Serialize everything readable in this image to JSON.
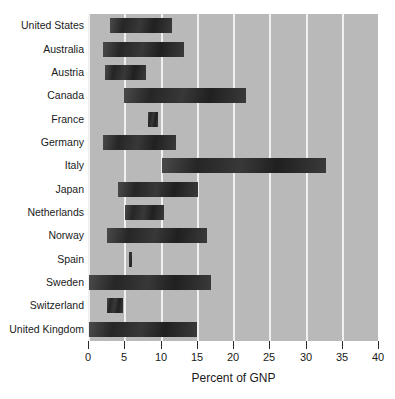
{
  "chart_data": {
    "type": "bar",
    "orientation": "horizontal",
    "bar_style": "floating-range",
    "title": "",
    "subtitle": "",
    "xlabel": "Percent of GNP",
    "ylabel": "",
    "xlim": [
      0,
      40
    ],
    "ylim": null,
    "xticks": [
      0,
      5,
      10,
      15,
      20,
      25,
      30,
      35,
      40
    ],
    "xticklabels": [
      "0",
      "5",
      "10",
      "15",
      "20",
      "25",
      "30",
      "35",
      "40"
    ],
    "grid": "vertical-white-gridlines",
    "legend": null,
    "legend_position": "none",
    "plot_background": "#b9b9b9",
    "bar_color": "#2b2b2b",
    "gridline_color": "#f0f0f0",
    "categories": [
      "United States",
      "Australia",
      "Austria",
      "Canada",
      "France",
      "Germany",
      "Italy",
      "Japan",
      "Netherlands",
      "Norway",
      "Spain",
      "Sweden",
      "Switzerland",
      "United Kingdom"
    ],
    "series": [
      {
        "name": "Percent of GNP range",
        "starts": [
          3.0,
          2.1,
          2.3,
          5.0,
          8.3,
          2.0,
          10.2,
          4.1,
          5.1,
          2.6,
          5.7,
          0.1,
          2.6,
          0.1
        ],
        "ends": [
          11.6,
          13.3,
          8.0,
          21.8,
          9.7,
          12.2,
          32.8,
          15.2,
          10.5,
          16.4,
          6.1,
          16.9,
          4.8,
          15.0
        ]
      }
    ]
  }
}
